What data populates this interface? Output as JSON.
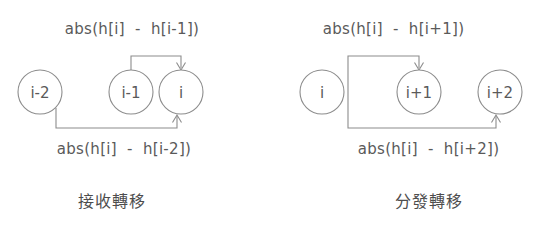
{
  "figure": {
    "background_color": "#ffffff",
    "line_color": "#8c8c8c",
    "text_color": "#5a5a5a"
  },
  "panels": [
    {
      "id": "receive-transition",
      "caption": "接收轉移",
      "top_label": "abs(h[i]  -  h[i-1])",
      "bottom_label": "abs(h[i]  -  h[i-2])",
      "nodes": [
        {
          "id": "node-i-minus-2",
          "label": "i-2",
          "cx": 40,
          "cy": 92,
          "r": 22
        },
        {
          "id": "node-i-minus-1",
          "label": "i-1",
          "cx": 131,
          "cy": 92,
          "r": 22
        },
        {
          "id": "node-i",
          "label": "i",
          "cx": 181,
          "cy": 92,
          "r": 22
        }
      ],
      "edges": [
        {
          "id": "edge-i-minus-1-to-i",
          "from": "i-1",
          "to": "i",
          "route": "top"
        },
        {
          "id": "edge-i-minus-2-to-i",
          "from": "i-2",
          "to": "i",
          "route": "bottom"
        }
      ]
    },
    {
      "id": "distribute-transition",
      "caption": "分發轉移",
      "top_label": "abs(h[i]  -  h[i+1])",
      "bottom_label": "abs(h[i]  -  h[i+2])",
      "nodes": [
        {
          "id": "node-i",
          "label": "i",
          "cx": 52,
          "cy": 92,
          "r": 22
        },
        {
          "id": "node-i-plus-1",
          "label": "i+1",
          "cx": 149,
          "cy": 92,
          "r": 22
        },
        {
          "id": "node-i-plus-2",
          "label": "i+2",
          "cx": 230,
          "cy": 92,
          "r": 22
        }
      ],
      "edges": [
        {
          "id": "edge-i-to-i-plus-1",
          "from": "i",
          "to": "i+1",
          "route": "top"
        },
        {
          "id": "edge-i-to-i-plus-2",
          "from": "i",
          "to": "i+2",
          "route": "bottom"
        }
      ]
    }
  ]
}
